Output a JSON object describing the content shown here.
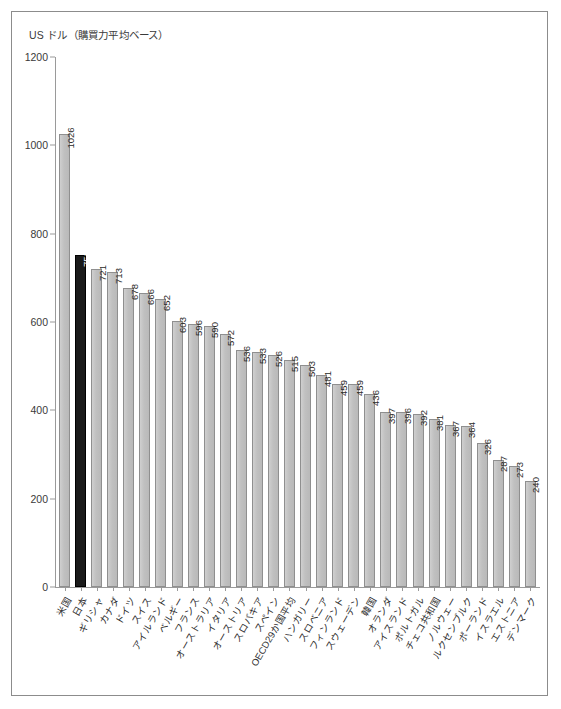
{
  "chart_data": {
    "type": "bar",
    "title": "US ドル（購買力平均ベース）",
    "xlabel": "",
    "ylabel": "US ドル（購買力平均ベース）",
    "ylim": [
      0,
      1200
    ],
    "yticks": [
      0,
      200,
      400,
      600,
      800,
      1000,
      1200
    ],
    "grid": false,
    "legend": "none",
    "highlight_category": "日本",
    "highlight_color": "#1a1a1a",
    "bar_color": "#c3c3c3",
    "categories": [
      "米国",
      "日本",
      "ギリシャ",
      "カナダ",
      "ドイツ",
      "スイス",
      "アイルランド",
      "ベルギー",
      "フランス",
      "オーストラリア",
      "イタリア",
      "オーストリア",
      "スロバキア",
      "スペイン",
      "OECD29か国平均",
      "ハンガリー",
      "スロベニア",
      "フィンランド",
      "スウェーデン",
      "韓国",
      "オランダ",
      "アイスランド",
      "ポルトガル",
      "チェコ共和国",
      "ノルウェー",
      "ルクセンブルク",
      "ポーランド",
      "イスラエル",
      "エストニア",
      "デンマーク"
    ],
    "values": [
      1026,
      752,
      721,
      713,
      678,
      666,
      652,
      603,
      596,
      590,
      572,
      536,
      533,
      526,
      515,
      503,
      481,
      459,
      459,
      436,
      397,
      396,
      392,
      381,
      367,
      364,
      326,
      287,
      273,
      240
    ]
  }
}
